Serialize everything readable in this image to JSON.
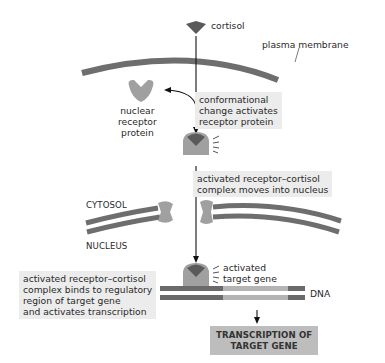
{
  "diagram": {
    "labels": {
      "cortisol": "cortisol",
      "plasma_membrane": "plasma membrane",
      "nuclear_receptor_protein": [
        "nuclear",
        "receptor",
        "protein"
      ],
      "cytosol": "CYTOSOL",
      "nucleus": "NUCLEUS",
      "activated_target_gene": [
        "activated",
        "target gene"
      ],
      "dna": "DNA"
    },
    "steps": [
      {
        "id": "conformational-change",
        "lines": [
          "conformational",
          "change activates",
          "receptor protein"
        ]
      },
      {
        "id": "moves-into-nucleus",
        "lines": [
          "activated receptor–cortisol",
          "complex moves into nucleus"
        ]
      },
      {
        "id": "binds-regulatory-region",
        "lines": [
          "activated receptor–cortisol",
          "complex binds to regulatory",
          "region of target gene",
          "and activates transcription"
        ]
      }
    ],
    "result": {
      "lines": [
        "TRANSCRIPTION OF",
        "TARGET GENE"
      ]
    },
    "colors": {
      "membrane": "#6e6e6e",
      "receptor": "#a0a0a0",
      "cortisol": "#5a5a5a",
      "dna_dark": "#6a6a6a",
      "dna_light": "#b4b4b4",
      "text_box": "#ececec",
      "result_box": "#bdbdbd"
    }
  }
}
